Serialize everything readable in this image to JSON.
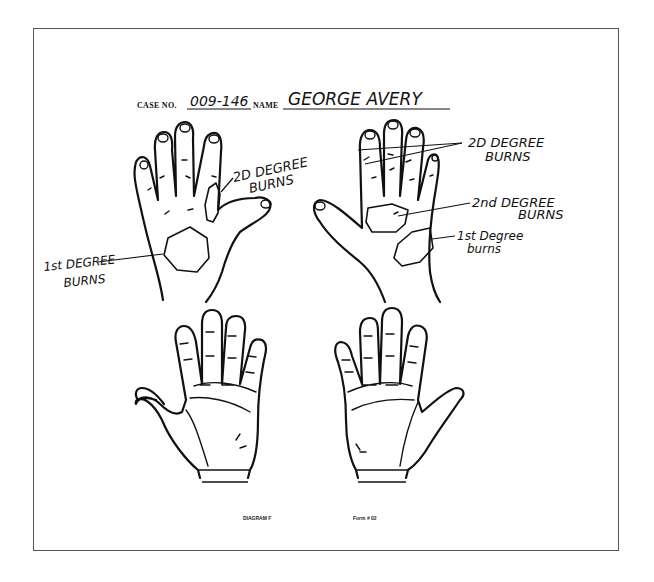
{
  "form": {
    "case_label": "CASE NO.",
    "case_number": "009-146",
    "name_label": "NAME",
    "patient_name": "GEORGE AVERY"
  },
  "annotations": {
    "left_back": {
      "burn_2nd_line1": "2D DEGREE",
      "burn_2nd_line2": "BURNS",
      "burn_1st_line1": "1st DEGREE",
      "burn_1st_line2": "BURNS"
    },
    "right_back": {
      "fingers_2nd_line1": "2D DEGREE",
      "fingers_2nd_line2": "BURNS",
      "palm_2nd_line1": "2nd DEGREE",
      "palm_2nd_line2": "BURNS",
      "burn_1st_line1": "1st Degree",
      "burn_1st_line2": "burns"
    }
  },
  "diagrams": [
    {
      "id": "back-left",
      "view": "dorsal",
      "side": "left-image"
    },
    {
      "id": "back-right",
      "view": "dorsal",
      "side": "right-image"
    },
    {
      "id": "palm-left",
      "view": "palmar",
      "side": "left-image"
    },
    {
      "id": "palm-right",
      "view": "palmar",
      "side": "right-image"
    }
  ],
  "footer": {
    "diagram_label": "DIAGRAM F",
    "form_code": "Form # 02"
  },
  "colors": {
    "ink": "#111111",
    "frame": "#555555",
    "paper": "#ffffff"
  }
}
